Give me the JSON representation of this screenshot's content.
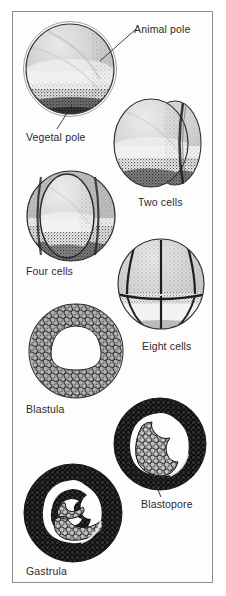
{
  "figure": {
    "kind": "scientific-illustration",
    "background_color": "#ffffff",
    "border_color": "#8d8d8d",
    "ink_color": "#2a2a2a"
  },
  "labels": {
    "animal_pole": "Animal pole",
    "vegetal_pole": "Vegetal pole",
    "two_cells": "Two cells",
    "four_cells": "Four cells",
    "eight_cells": "Eight cells",
    "blastula": "Blastula",
    "blastopore": "Blastopore",
    "gastrula": "Gastrula"
  },
  "stages": [
    {
      "name": "fertilized-egg",
      "label": "",
      "cells": 1
    },
    {
      "name": "two-cell-stage",
      "label": "Two cells",
      "cells": 2
    },
    {
      "name": "four-cell-stage",
      "label": "Four cells",
      "cells": 4
    },
    {
      "name": "eight-cell-stage",
      "label": "Eight cells",
      "cells": 8
    },
    {
      "name": "blastula-stage",
      "label": "Blastula",
      "cells": "many"
    },
    {
      "name": "blastopore-stage",
      "label": "Blastopore",
      "cells": "many"
    },
    {
      "name": "gastrula-stage",
      "label": "Gastrula",
      "cells": "many"
    }
  ],
  "colors": {
    "animal_hemisphere": "#c9c9c9",
    "vegetal_hemisphere": "#f2f2f2",
    "pigment_stipple": "#1a1a1a",
    "cell_fill": "#b4b4b4",
    "cell_outline": "#2b2b2b"
  }
}
